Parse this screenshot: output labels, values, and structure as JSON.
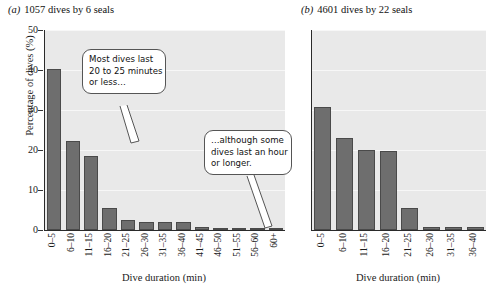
{
  "figure": {
    "panels": [
      {
        "key": "a",
        "label": "(a)",
        "title": "1057 dives by 6 seals"
      },
      {
        "key": "b",
        "label": "(b)",
        "title": "4601 dives by 22 seals"
      }
    ],
    "axis": {
      "ylabel": "Percentage of dives (%)",
      "xlabel": "Dive duration (min)",
      "yticks": [
        "0",
        "10",
        "20",
        "30",
        "40",
        "50"
      ]
    },
    "callouts": [
      {
        "name": "callout-most-dives",
        "lines": [
          "Most dives last",
          "20 to 25 minutes",
          "or less…"
        ]
      },
      {
        "name": "callout-although-some",
        "lines": [
          "…although some",
          "dives last an hour",
          "or longer."
        ]
      }
    ],
    "colors": {
      "bar_fill": "#6e6e6e",
      "bar_edge": "#4a4a4a",
      "plot_background": "#e9e9e9",
      "axis": "#2a2a2a",
      "gridline": "#f7f7f7"
    }
  },
  "chart_data": [
    {
      "type": "bar",
      "panel": "a",
      "title": "1057 dives by 6 seals",
      "xlabel": "Dive duration (min)",
      "ylabel": "Percentage of dives (%)",
      "ylim": [
        0,
        50
      ],
      "grid": true,
      "legend": "none",
      "categories": [
        "0–5",
        "6–10",
        "11–15",
        "16–20",
        "21–25",
        "26–30",
        "31–35",
        "36–40",
        "41–45",
        "46–50",
        "51–55",
        "56–60",
        "60+"
      ],
      "values": [
        40.3,
        22.2,
        18.5,
        5.5,
        2.4,
        2.0,
        2.0,
        1.9,
        0.7,
        0.6,
        0.6,
        0.6,
        0.6
      ]
    },
    {
      "type": "bar",
      "panel": "b",
      "title": "4601 dives by 22 seals",
      "xlabel": "Dive duration (min)",
      "ylabel": "Percentage of dives (%)",
      "ylim": [
        0,
        50
      ],
      "grid": true,
      "legend": "none",
      "categories": [
        "0–5",
        "6–10",
        "11–15",
        "16–20",
        "21–25",
        "26–30",
        "31–35",
        "36–40"
      ],
      "values": [
        30.8,
        22.9,
        20.0,
        19.8,
        5.6,
        0.7,
        0.7,
        0.7
      ]
    }
  ]
}
